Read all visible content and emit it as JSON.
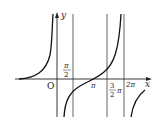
{
  "diagram": {
    "type": "function-graph",
    "axes": {
      "x_label": "x",
      "y_label": "y",
      "origin_label": "O"
    },
    "tick_labels": {
      "pi_over_2_num": "π",
      "pi_over_2_den": "2",
      "pi": "π",
      "three_pi_over_2_num": "3",
      "three_pi_over_2_den": "2",
      "three_pi_over_2_suffix": "π",
      "two_pi": "2π"
    },
    "colors": {
      "line": "#222222",
      "curve": "#111111",
      "background": "#ffffff"
    }
  }
}
